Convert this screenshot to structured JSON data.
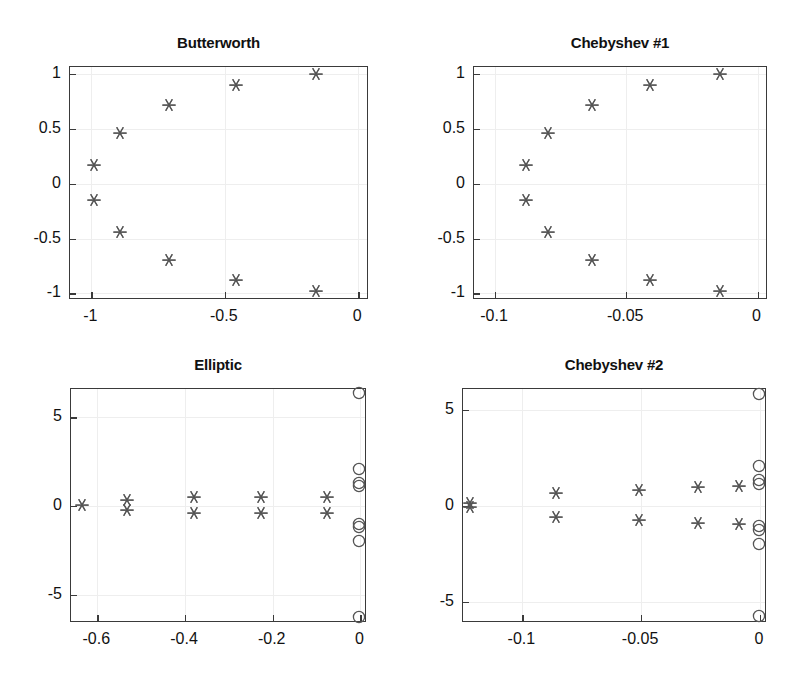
{
  "figure": {
    "width": 810,
    "height": 694,
    "background": "#ffffff",
    "marker_color": "#555555",
    "axis_color": "#3a3a3a",
    "grid_color": "#eeeeee"
  },
  "chart_data": [
    {
      "id": "butterworth",
      "type": "scatter",
      "title": "Butterworth",
      "xlabel": "",
      "ylabel": "",
      "xlim": [
        -1.08,
        0.04
      ],
      "ylim": [
        -1.06,
        1.06
      ],
      "xticks": [
        -1,
        -0.5,
        0
      ],
      "xticklabels": [
        "-1",
        "-0.5",
        "0"
      ],
      "yticks": [
        -1,
        -0.5,
        0,
        0.5,
        1
      ],
      "yticklabels": [
        "-1",
        "-0.5",
        "0",
        "0.5",
        "1"
      ],
      "grid": true,
      "legend": "none",
      "series": [
        {
          "name": "poles",
          "marker": "asterisk",
          "points": [
            {
              "x": -0.156,
              "y": 0.988
            },
            {
              "x": -0.454,
              "y": 0.891
            },
            {
              "x": -0.707,
              "y": 0.707
            },
            {
              "x": -0.891,
              "y": 0.454
            },
            {
              "x": -0.988,
              "y": 0.156
            },
            {
              "x": -0.988,
              "y": -0.156
            },
            {
              "x": -0.891,
              "y": -0.454
            },
            {
              "x": -0.707,
              "y": -0.707
            },
            {
              "x": -0.454,
              "y": -0.891
            },
            {
              "x": -0.156,
              "y": -0.988
            }
          ]
        }
      ]
    },
    {
      "id": "chebyshev1",
      "type": "scatter",
      "title": "Chebyshev #1",
      "xlabel": "",
      "ylabel": "",
      "xlim": [
        -0.108,
        0.004
      ],
      "ylim": [
        -1.06,
        1.06
      ],
      "xticks": [
        -0.1,
        -0.05,
        0
      ],
      "xticklabels": [
        "-0.1",
        "-0.05",
        "0"
      ],
      "yticks": [
        -1,
        -0.5,
        0,
        0.5,
        1
      ],
      "yticklabels": [
        "-1",
        "-0.5",
        "0",
        "0.5",
        "1"
      ],
      "grid": true,
      "legend": "none",
      "series": [
        {
          "name": "poles",
          "marker": "asterisk",
          "points": [
            {
              "x": -0.0139,
              "y": 0.988
            },
            {
              "x": -0.0406,
              "y": 0.891
            },
            {
              "x": -0.0625,
              "y": 0.707
            },
            {
              "x": -0.0795,
              "y": 0.454
            },
            {
              "x": -0.0878,
              "y": 0.156
            },
            {
              "x": -0.0878,
              "y": -0.156
            },
            {
              "x": -0.0795,
              "y": -0.454
            },
            {
              "x": -0.0625,
              "y": -0.707
            },
            {
              "x": -0.0406,
              "y": -0.891
            },
            {
              "x": -0.0139,
              "y": -0.988
            }
          ]
        }
      ]
    },
    {
      "id": "elliptic",
      "type": "scatter",
      "title": "Elliptic",
      "xlabel": "",
      "ylabel": "",
      "xlim": [
        -0.66,
        0.015
      ],
      "ylim": [
        -6.6,
        6.6
      ],
      "xticks": [
        -0.6,
        -0.4,
        -0.2,
        0
      ],
      "xticklabels": [
        "-0.6",
        "-0.4",
        "-0.2",
        "0"
      ],
      "yticks": [
        -5,
        0,
        5
      ],
      "yticklabels": [
        "-5",
        "0",
        "5"
      ],
      "grid": true,
      "legend": "none",
      "series": [
        {
          "name": "poles",
          "marker": "asterisk",
          "points": [
            {
              "x": -0.632,
              "y": 0.0
            },
            {
              "x": -0.53,
              "y": 0.3
            },
            {
              "x": -0.53,
              "y": -0.3
            },
            {
              "x": -0.378,
              "y": 0.45
            },
            {
              "x": -0.378,
              "y": -0.45
            },
            {
              "x": -0.225,
              "y": 0.47
            },
            {
              "x": -0.225,
              "y": -0.47
            },
            {
              "x": -0.073,
              "y": 0.45
            },
            {
              "x": -0.073,
              "y": -0.45
            }
          ]
        },
        {
          "name": "zeros",
          "marker": "circle",
          "points": [
            {
              "x": 0.0,
              "y": 6.3
            },
            {
              "x": 0.0,
              "y": 2.05
            },
            {
              "x": 0.0,
              "y": 1.25
            },
            {
              "x": 0.0,
              "y": 1.05
            },
            {
              "x": 0.0,
              "y": -1.05
            },
            {
              "x": 0.0,
              "y": -1.25
            },
            {
              "x": 0.0,
              "y": -2.05
            },
            {
              "x": 0.0,
              "y": -6.3
            }
          ]
        }
      ]
    },
    {
      "id": "chebyshev2",
      "type": "scatter",
      "title": "Chebyshev #2",
      "xlabel": "",
      "ylabel": "",
      "xlim": [
        -0.125,
        0.003
      ],
      "ylim": [
        -6.1,
        6.1
      ],
      "xticks": [
        -0.1,
        -0.05,
        0
      ],
      "xticklabels": [
        "-0.1",
        "-0.05",
        "0"
      ],
      "yticks": [
        -5,
        0,
        5
      ],
      "yticklabels": [
        "-5",
        "0",
        "5"
      ],
      "grid": true,
      "legend": "none",
      "series": [
        {
          "name": "poles",
          "marker": "asterisk",
          "points": [
            {
              "x": -0.1215,
              "y": 0.12
            },
            {
              "x": -0.1215,
              "y": -0.12
            },
            {
              "x": -0.0855,
              "y": 0.62
            },
            {
              "x": -0.0855,
              "y": -0.62
            },
            {
              "x": -0.0505,
              "y": 0.8
            },
            {
              "x": -0.0505,
              "y": -0.8
            },
            {
              "x": -0.0255,
              "y": 0.95
            },
            {
              "x": -0.0255,
              "y": -0.95
            },
            {
              "x": -0.0085,
              "y": 1.0
            },
            {
              "x": -0.0085,
              "y": -1.0
            }
          ]
        },
        {
          "name": "zeros",
          "marker": "circle",
          "points": [
            {
              "x": 0.0,
              "y": 5.8
            },
            {
              "x": 0.0,
              "y": 2.05
            },
            {
              "x": 0.0,
              "y": 1.3
            },
            {
              "x": 0.0,
              "y": 1.1
            },
            {
              "x": 0.0,
              "y": -1.1
            },
            {
              "x": 0.0,
              "y": -1.3
            },
            {
              "x": 0.0,
              "y": -2.05
            },
            {
              "x": 0.0,
              "y": -5.8
            }
          ]
        }
      ]
    }
  ],
  "panels": [
    {
      "id": "butterworth",
      "left": 69,
      "top": 66,
      "width": 299,
      "height": 233,
      "title_top": -32
    },
    {
      "id": "chebyshev1",
      "left": 473,
      "top": 66,
      "width": 294,
      "height": 233,
      "title_top": -32
    },
    {
      "id": "elliptic",
      "left": 70,
      "top": 388,
      "width": 296,
      "height": 234,
      "title_top": -32
    },
    {
      "id": "chebyshev2",
      "left": 462,
      "top": 388,
      "width": 304,
      "height": 234,
      "title_top": -32
    }
  ]
}
